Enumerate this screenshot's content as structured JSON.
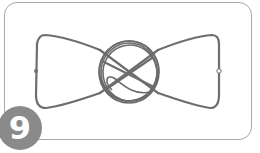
{
  "step": {
    "number": "9"
  },
  "illustration": {
    "subject": "wire bow-tie with wrapped center knot",
    "colors": {
      "wire": "#6e6e6e",
      "frame": "#a8a8a8",
      "badge": "#8a8a8a",
      "badge_text": "#ffffff",
      "background": "#ffffff"
    }
  }
}
